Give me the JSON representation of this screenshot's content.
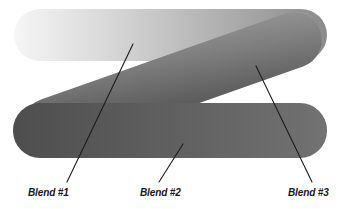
{
  "figure": {
    "width": 344,
    "height": 209,
    "background": "#ffffff"
  },
  "bars": [
    {
      "id": "top-bar",
      "name": "blend-bar-top",
      "shape": "rounded-pill-horizontal",
      "x": 14,
      "y": 9,
      "width": 313,
      "height": 52,
      "radius": 26,
      "gradient": {
        "type": "linear",
        "angle_deg": 0,
        "from": "#f4f4f4",
        "mid": "#c2c2c2",
        "to": "#8c8c8c"
      }
    },
    {
      "id": "diagonal-bar",
      "name": "blend-bar-diagonal",
      "shape": "rounded-pill-diagonal",
      "x1": 44,
      "y1": 128,
      "x2": 300,
      "y2": 38,
      "thickness": 56,
      "gradient": {
        "type": "linear",
        "angle_deg": 20,
        "from": "#4d4d4d",
        "mid": "#6f6f6f",
        "to": "#8e8e8e"
      }
    },
    {
      "id": "bottom-bar",
      "name": "blend-bar-bottom",
      "shape": "rounded-pill-horizontal",
      "x": 13,
      "y": 103,
      "width": 314,
      "height": 55,
      "radius": 27,
      "gradient": {
        "type": "linear",
        "angle_deg": 0,
        "from": "#4f4f4f",
        "mid": "#626262",
        "to": "#717171"
      }
    }
  ],
  "annotations": [
    {
      "id": "blend-1",
      "label": "Blend #1",
      "label_x": 28,
      "label_y": 196,
      "leader": {
        "x1": 133,
        "y1": 44,
        "x2": 67,
        "y2": 182
      }
    },
    {
      "id": "blend-2",
      "label": "Blend #2",
      "label_x": 140,
      "label_y": 196,
      "leader": {
        "x1": 183,
        "y1": 144,
        "x2": 159,
        "y2": 182
      }
    },
    {
      "id": "blend-3",
      "label": "Blend #3",
      "label_x": 288,
      "label_y": 196,
      "leader": {
        "x1": 256,
        "y1": 66,
        "x2": 312,
        "y2": 182
      }
    }
  ],
  "palette": {
    "line_color": "#1c1c1c",
    "text_color": "#1a1a1a",
    "background": "#ffffff"
  }
}
